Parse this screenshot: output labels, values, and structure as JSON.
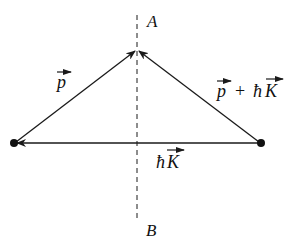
{
  "diagram": {
    "type": "vector-triangle",
    "colors": {
      "line": "#1a1a1a",
      "background": "#ffffff",
      "text": "#111111"
    },
    "points": {
      "left": {
        "x": 14,
        "y": 143
      },
      "right": {
        "x": 261,
        "y": 143
      },
      "apex": {
        "x": 137,
        "y": 50
      }
    },
    "plane": {
      "style": "dashed",
      "top_label": "A",
      "bottom_label": "B"
    },
    "vectors": [
      {
        "name": "p",
        "from": "left",
        "to": "apex",
        "label": "p",
        "has_arrow_over": true
      },
      {
        "name": "p-plus-hK",
        "from": "right",
        "to": "apex",
        "label_p": "p",
        "label_plus": "+",
        "label_h": "ħ",
        "label_K": "K",
        "has_arrow_over": true
      },
      {
        "name": "hK",
        "from": "right",
        "to": "left",
        "label_h": "ħ",
        "label_K": "K",
        "has_arrow_over": true
      }
    ]
  }
}
